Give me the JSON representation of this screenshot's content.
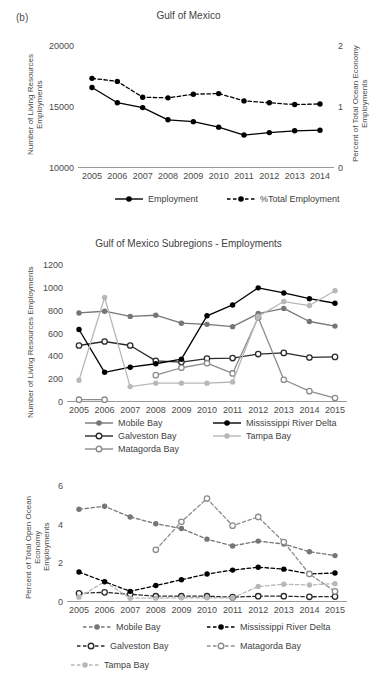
{
  "panel_tag": "(b)",
  "chart_data": [
    {
      "id": "gulf-of-mexico",
      "type": "line",
      "title": "Gulf of Mexico",
      "xlabel": "",
      "ylabel": "Number of Living Resources\nEmployments",
      "ylabel_right": "Percent of Total Ocean Economy\nEmployments",
      "x": [
        2005,
        2006,
        2007,
        2008,
        2009,
        2010,
        2011,
        2012,
        2013,
        2014
      ],
      "xticklabels": [
        "2005",
        "2006",
        "2007",
        "2008",
        "2009",
        "2010",
        "2011",
        "2012",
        "2013",
        "2014"
      ],
      "ylim": [
        10000,
        20000
      ],
      "yticks": [
        10000,
        15000,
        20000
      ],
      "yticklabels": [
        "10000",
        "15000",
        "20000"
      ],
      "ylim_right": [
        0,
        2
      ],
      "yticks_right": [
        0,
        1,
        2
      ],
      "yticklabels_right": [
        "0",
        "1",
        "2"
      ],
      "grid": false,
      "legend_position": "bottom",
      "series": [
        {
          "name": "Employment",
          "axis": "left",
          "style": "solid",
          "marker": "filled-circle",
          "color": "#000000",
          "values": [
            16600,
            15350,
            14950,
            13950,
            13800,
            13350,
            12700,
            12900,
            13050,
            13100
          ]
        },
        {
          "name": "%Total Employment",
          "axis": "right",
          "style": "dashed",
          "marker": "filled-circle",
          "color": "#000000",
          "values": [
            1.47,
            1.42,
            1.16,
            1.15,
            1.21,
            1.22,
            1.1,
            1.07,
            1.04,
            1.05
          ]
        }
      ]
    },
    {
      "id": "subregions-employments",
      "type": "line",
      "title": "Gulf of Mexico Subregions - Employments",
      "xlabel": "",
      "ylabel": "Number of Living Resources Employments",
      "x": [
        2005,
        2006,
        2007,
        2008,
        2009,
        2010,
        2011,
        2012,
        2013,
        2014,
        2015
      ],
      "xticklabels": [
        "2005",
        "2006",
        "2007",
        "2008",
        "2009",
        "2010",
        "2011",
        "2012",
        "2013",
        "2014",
        "2015"
      ],
      "ylim": [
        0,
        1200
      ],
      "yticks": [
        0,
        200,
        400,
        600,
        800,
        1000,
        1200
      ],
      "yticklabels": [
        "0",
        "200",
        "400",
        "600",
        "800",
        "1000",
        "1200"
      ],
      "grid": false,
      "legend_position": "bottom",
      "series": [
        {
          "name": "Mobile Bay",
          "style": "solid",
          "marker": "filled-circle",
          "color": "#767676",
          "values": [
            780,
            795,
            750,
            760,
            690,
            680,
            660,
            775,
            820,
            705,
            665
          ]
        },
        {
          "name": "Galveston Bay",
          "style": "solid",
          "marker": "open-circle",
          "color": "#2b2b2b",
          "values": [
            495,
            530,
            495,
            360,
            350,
            380,
            385,
            420,
            430,
            390,
            395
          ]
        },
        {
          "name": "Matagorda Bay",
          "style": "solid",
          "marker": "open-circle",
          "color": "#8c8c8c",
          "values": [
            20,
            20,
            null,
            235,
            300,
            340,
            250,
            740,
            195,
            95,
            35
          ]
        },
        {
          "name": "Mississippi River Delta",
          "style": "solid",
          "marker": "filled-circle",
          "color": "#000000",
          "values": [
            635,
            260,
            305,
            335,
            375,
            755,
            850,
            1000,
            955,
            905,
            865
          ]
        },
        {
          "name": "Tampa Bay",
          "style": "solid",
          "marker": "filled-circle",
          "color": "#b8b8b8",
          "values": [
            190,
            915,
            135,
            165,
            165,
            165,
            175,
            750,
            880,
            845,
            975
          ]
        }
      ]
    },
    {
      "id": "subregions-percent",
      "type": "line",
      "title": "",
      "xlabel": "",
      "ylabel": "Percent of Total Open Ocean Economy\nEmployments",
      "x": [
        2005,
        2006,
        2007,
        2008,
        2009,
        2010,
        2011,
        2012,
        2013,
        2014,
        2015
      ],
      "xticklabels": [
        "2005",
        "2006",
        "2007",
        "2008",
        "2009",
        "2010",
        "2011",
        "2012",
        "2013",
        "2014",
        "2015"
      ],
      "ylim": [
        0,
        6
      ],
      "yticks": [
        0,
        2,
        4,
        6
      ],
      "yticklabels": [
        "0",
        "2",
        "4",
        "6"
      ],
      "grid": false,
      "legend_position": "bottom",
      "series": [
        {
          "name": "Mobile Bay",
          "style": "dashed",
          "marker": "filled-circle",
          "color": "#767676",
          "values": [
            4.8,
            4.95,
            4.4,
            4.05,
            3.8,
            3.25,
            2.9,
            3.15,
            3.0,
            2.6,
            2.4
          ]
        },
        {
          "name": "Galveston Bay",
          "style": "dashed",
          "marker": "open-circle",
          "color": "#2b2b2b",
          "values": [
            0.45,
            0.5,
            0.4,
            0.3,
            0.3,
            0.3,
            0.25,
            0.3,
            0.3,
            0.27,
            0.28
          ]
        },
        {
          "name": "Tampa Bay",
          "style": "dashed",
          "marker": "filled-circle",
          "color": "#b8b8b8",
          "values": [
            0.25,
            1.05,
            0.2,
            0.2,
            0.22,
            0.22,
            0.22,
            0.8,
            0.92,
            0.88,
            0.95
          ]
        },
        {
          "name": "Mississippi River Delta",
          "style": "dashed",
          "marker": "filled-circle",
          "color": "#000000",
          "values": [
            1.55,
            1.05,
            0.55,
            0.85,
            1.15,
            1.45,
            1.65,
            1.8,
            1.7,
            1.45,
            1.5
          ]
        },
        {
          "name": "Matagorda Bay",
          "style": "dashed",
          "marker": "open-circle",
          "color": "#8c8c8c",
          "values": [
            null,
            null,
            null,
            2.7,
            4.15,
            5.35,
            3.95,
            4.4,
            3.1,
            1.45,
            0.55
          ]
        }
      ]
    }
  ]
}
